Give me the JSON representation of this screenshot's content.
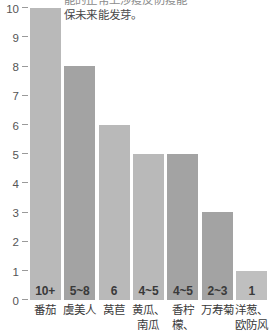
{
  "caption": {
    "line1": "能的正常上涉疫反防疫能",
    "line2": "保未来能发芽。"
  },
  "chart_data": {
    "type": "bar",
    "title": "",
    "xlabel": "",
    "ylabel": "",
    "ylim": [
      0,
      10
    ],
    "grid": false,
    "legend": null,
    "categories": [
      "番茄",
      "虞美人",
      "莴苣",
      "黄瓜、南瓜",
      "香柠檬、",
      "万寿菊",
      "洋葱、欧防风"
    ],
    "values": [
      10,
      8,
      6,
      5,
      5,
      3,
      1
    ],
    "value_labels": [
      "10+",
      "5~8",
      "6",
      "4~5",
      "4~5",
      "2~3",
      "1"
    ],
    "yticks": [
      "0",
      "1",
      "2",
      "3",
      "4",
      "5",
      "6",
      "7",
      "8",
      "9",
      "10"
    ],
    "bar_colors": [
      "#b9b9b9",
      "#a3a3a3",
      "#b9b9b9",
      "#b9b9b9",
      "#a3a3a3",
      "#a3a3a3",
      "#bfbfbf"
    ],
    "axis_color": "#9a9a9a",
    "tick_label_color": "#555555"
  }
}
